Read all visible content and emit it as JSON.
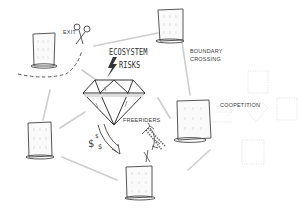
{
  "diagram": {
    "title_line1": "ECOSYSTEM",
    "title_line2": "RISKS",
    "labels": {
      "exit": "EXIT",
      "boundary_line1": "BOUNDARY",
      "boundary_line2": "CROSSING",
      "coopetition": "COOPETITION",
      "freeriders": "FREERIDERS"
    },
    "center_icon": "diamond-icon",
    "icons": [
      "scissors-icon",
      "lightning-icon",
      "dollar-icon",
      "arrow-icon",
      "hand-icon",
      "building-icon"
    ],
    "colors": {
      "ink": "#3a3a3a",
      "connector": "#c8c8c8",
      "faded": "#d6d6d6",
      "background": "#ffffff"
    }
  }
}
